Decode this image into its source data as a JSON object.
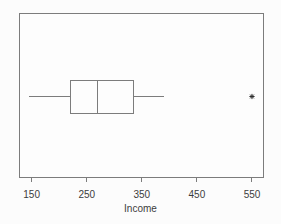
{
  "chart_data": {
    "type": "boxplot",
    "orientation": "horizontal",
    "title": "",
    "xlabel": "Income",
    "x_ticks": [
      150,
      250,
      350,
      450,
      550
    ],
    "xlim": [
      127,
      570
    ],
    "grid": false,
    "stats": {
      "whisker_low": 145,
      "q1": 220,
      "median": 270,
      "q3": 335,
      "whisker_high": 390
    },
    "outliers": [
      550
    ],
    "outlier_symbol": "*",
    "colors": {
      "line": "#7c7c7c",
      "text": "#3c3c3c",
      "marker": "#2e2e2e",
      "plot_bg": "#fdfdfd"
    },
    "layout": {
      "left": 19,
      "top": 13,
      "right": 263,
      "bottom": 177,
      "box_top": 80,
      "box_bottom": 113,
      "tick_len": 5,
      "tick_label_baseline_offset": 21
    }
  }
}
